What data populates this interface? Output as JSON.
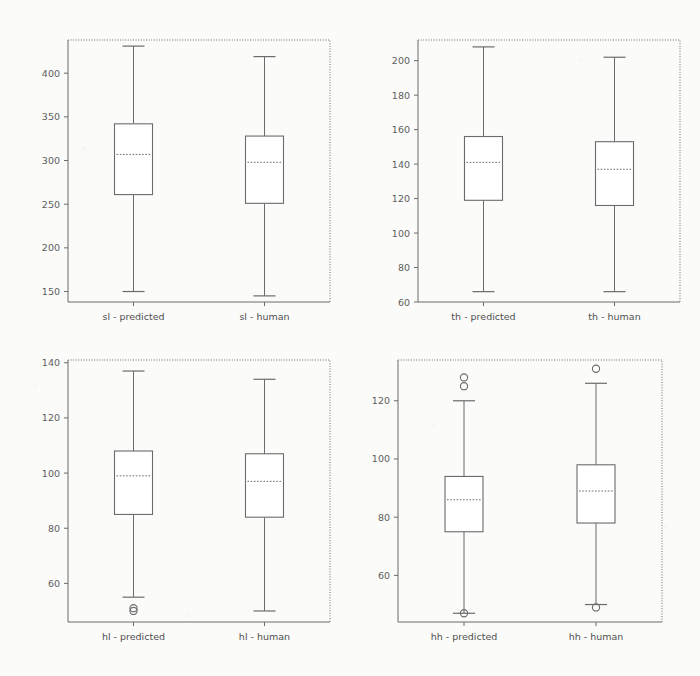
{
  "figure": {
    "type": "boxplot-grid",
    "rows": 2,
    "columns": 2,
    "background_color": "#fbfbfa",
    "line_color": "#6b6b6b"
  },
  "chart_data": [
    {
      "type": "box",
      "panel_id": "sl",
      "title": "",
      "xlabel": "",
      "ylabel": "",
      "grid": false,
      "legend": "none",
      "ylim": [
        138,
        438
      ],
      "yticks": [
        150,
        200,
        250,
        300,
        350,
        400
      ],
      "ytick_labels": [
        "150",
        "200",
        "250",
        "300",
        "350",
        "400"
      ],
      "categories": [
        "sl - predicted",
        "sl - human"
      ],
      "boxes": [
        {
          "label": "sl - predicted",
          "whisker_low": 150,
          "q1": 261,
          "median": 307,
          "q3": 342,
          "whisker_high": 431,
          "outliers": []
        },
        {
          "label": "sl - human",
          "whisker_low": 145,
          "q1": 251,
          "median": 298,
          "q3": 328,
          "whisker_high": 419,
          "outliers": []
        }
      ]
    },
    {
      "type": "box",
      "panel_id": "th",
      "title": "",
      "xlabel": "",
      "ylabel": "",
      "grid": false,
      "legend": "none",
      "ylim": [
        60,
        212
      ],
      "yticks": [
        60,
        80,
        100,
        120,
        140,
        160,
        180,
        200
      ],
      "ytick_labels": [
        "60",
        "80",
        "100",
        "120",
        "140",
        "160",
        "180",
        "200"
      ],
      "categories": [
        "th - predicted",
        "th - human"
      ],
      "boxes": [
        {
          "label": "th - predicted",
          "whisker_low": 66,
          "q1": 119,
          "median": 141,
          "q3": 156,
          "whisker_high": 208,
          "outliers": []
        },
        {
          "label": "th - human",
          "whisker_low": 66,
          "q1": 116,
          "median": 137,
          "q3": 153,
          "whisker_high": 202,
          "outliers": []
        }
      ]
    },
    {
      "type": "box",
      "panel_id": "hl",
      "title": "",
      "xlabel": "",
      "ylabel": "",
      "grid": false,
      "legend": "none",
      "ylim": [
        46,
        141
      ],
      "yticks": [
        60,
        80,
        100,
        120,
        140
      ],
      "ytick_labels": [
        "60",
        "80",
        "100",
        "120",
        "140"
      ],
      "categories": [
        "hl - predicted",
        "hl - human"
      ],
      "boxes": [
        {
          "label": "hl - predicted",
          "whisker_low": 55,
          "q1": 85,
          "median": 99,
          "q3": 108,
          "whisker_high": 137,
          "outliers": [
            51,
            50
          ]
        },
        {
          "label": "hl - human",
          "whisker_low": 50,
          "q1": 84,
          "median": 97,
          "q3": 107,
          "whisker_high": 134,
          "outliers": []
        }
      ]
    },
    {
      "type": "box",
      "panel_id": "hh",
      "title": "",
      "xlabel": "",
      "ylabel": "",
      "grid": false,
      "legend": "none",
      "ylim": [
        44,
        134
      ],
      "yticks": [
        60,
        80,
        100,
        120
      ],
      "ytick_labels": [
        "60",
        "80",
        "100",
        "120"
      ],
      "categories": [
        "hh - predicted",
        "hh - human"
      ],
      "boxes": [
        {
          "label": "hh - predicted",
          "whisker_low": 47,
          "q1": 75,
          "median": 86,
          "q3": 94,
          "whisker_high": 120,
          "outliers": [
            128,
            125,
            47
          ]
        },
        {
          "label": "hh - human",
          "whisker_low": 50,
          "q1": 78,
          "median": 89,
          "q3": 98,
          "whisker_high": 126,
          "outliers": [
            131,
            49
          ]
        }
      ]
    }
  ]
}
